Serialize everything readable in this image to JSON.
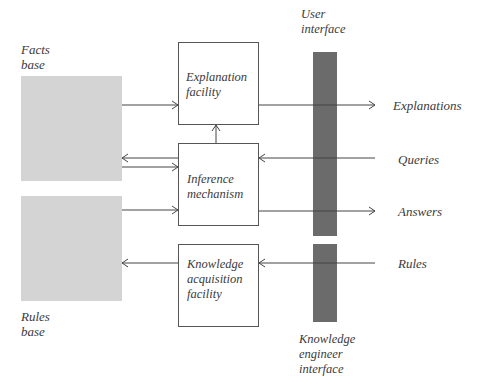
{
  "diagram": {
    "stores": {
      "facts": {
        "label_line1": "Facts",
        "label_line2": "base"
      },
      "rules": {
        "label_line1": "Rules",
        "label_line2": "base"
      }
    },
    "blocks": {
      "explanation": {
        "line1": "Explanation",
        "line2": "facility"
      },
      "inference": {
        "line1": "Inference",
        "line2": "mechanism"
      },
      "knowledge": {
        "line1": "Knowledge",
        "line2": "acquisition",
        "line3": "facility"
      }
    },
    "interfaces": {
      "user": {
        "line1": "User",
        "line2": "interface"
      },
      "engineer": {
        "line1": "Knowledge",
        "line2": "engineer",
        "line3": "interface"
      }
    },
    "flows": {
      "explanations": "Explanations",
      "queries": "Queries",
      "answers": "Answers",
      "rules": "Rules"
    },
    "colors": {
      "store_fill": "#d4d4d4",
      "interface_bar": "#6b6b6b",
      "line": "#444444"
    }
  }
}
